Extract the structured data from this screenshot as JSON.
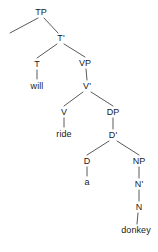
{
  "diagram": {
    "type": "syntax-tree",
    "sentence": "will ride a donkey",
    "background_color": "#ffffff",
    "line_color": "#5a5a5a",
    "text_color": "#1a1a1a",
    "width": 158,
    "height": 252,
    "nodes": [
      {
        "id": "TP",
        "label": "TP",
        "x": 41,
        "y": 12,
        "kind": "phrase"
      },
      {
        "id": "Tbar",
        "label": "T'",
        "x": 61,
        "y": 38,
        "kind": "bar"
      },
      {
        "id": "T",
        "label": "T",
        "x": 37,
        "y": 64,
        "kind": "head"
      },
      {
        "id": "will",
        "label": "will",
        "x": 37,
        "y": 86,
        "kind": "terminal"
      },
      {
        "id": "VP",
        "label": "VP",
        "x": 85,
        "y": 63,
        "kind": "phrase"
      },
      {
        "id": "Vbar",
        "label": "V'",
        "x": 87,
        "y": 86,
        "kind": "bar"
      },
      {
        "id": "V",
        "label": "V",
        "x": 64,
        "y": 112,
        "kind": "head"
      },
      {
        "id": "ride",
        "label": "ride",
        "x": 64,
        "y": 134,
        "kind": "terminal"
      },
      {
        "id": "DP",
        "label": "DP",
        "x": 113,
        "y": 112,
        "kind": "phrase"
      },
      {
        "id": "Dbar",
        "label": "D'",
        "x": 113,
        "y": 135,
        "kind": "bar"
      },
      {
        "id": "D",
        "label": "D",
        "x": 87,
        "y": 161,
        "kind": "head"
      },
      {
        "id": "a",
        "label": "a",
        "x": 87,
        "y": 182,
        "kind": "terminal"
      },
      {
        "id": "NP",
        "label": "NP",
        "x": 139,
        "y": 161,
        "kind": "phrase"
      },
      {
        "id": "Nbar",
        "label": "N'",
        "x": 139,
        "y": 184,
        "kind": "bar"
      },
      {
        "id": "N",
        "label": "N",
        "x": 139,
        "y": 207,
        "kind": "head"
      },
      {
        "id": "donkey",
        "label": "donkey",
        "x": 136,
        "y": 230,
        "kind": "terminal"
      }
    ],
    "edges": [
      {
        "from": "TP",
        "to": "specifier-empty",
        "x1": 38,
        "y1": 18,
        "x2": 10,
        "y2": 33
      },
      {
        "from": "TP",
        "to": "Tbar",
        "x1": 44,
        "y1": 18,
        "x2": 58,
        "y2": 33
      },
      {
        "from": "Tbar",
        "to": "T",
        "x1": 57,
        "y1": 44,
        "x2": 37,
        "y2": 58
      },
      {
        "from": "Tbar",
        "to": "VP",
        "x1": 64,
        "y1": 44,
        "x2": 85,
        "y2": 57
      },
      {
        "from": "T",
        "to": "will",
        "x1": 37,
        "y1": 70,
        "x2": 37,
        "y2": 79
      },
      {
        "from": "VP",
        "to": "Vbar",
        "x1": 86,
        "y1": 69,
        "x2": 87,
        "y2": 80
      },
      {
        "from": "Vbar",
        "to": "V",
        "x1": 83,
        "y1": 92,
        "x2": 64,
        "y2": 106
      },
      {
        "from": "Vbar",
        "to": "DP",
        "x1": 91,
        "y1": 92,
        "x2": 113,
        "y2": 106
      },
      {
        "from": "V",
        "to": "ride",
        "x1": 64,
        "y1": 118,
        "x2": 64,
        "y2": 127
      },
      {
        "from": "DP",
        "to": "Dbar",
        "x1": 113,
        "y1": 118,
        "x2": 113,
        "y2": 129
      },
      {
        "from": "Dbar",
        "to": "D",
        "x1": 109,
        "y1": 141,
        "x2": 87,
        "y2": 155
      },
      {
        "from": "Dbar",
        "to": "NP",
        "x1": 117,
        "y1": 141,
        "x2": 139,
        "y2": 155
      },
      {
        "from": "D",
        "to": "a",
        "x1": 87,
        "y1": 167,
        "x2": 87,
        "y2": 176
      },
      {
        "from": "NP",
        "to": "Nbar",
        "x1": 139,
        "y1": 167,
        "x2": 139,
        "y2": 178
      },
      {
        "from": "Nbar",
        "to": "N",
        "x1": 139,
        "y1": 190,
        "x2": 139,
        "y2": 201
      },
      {
        "from": "N",
        "to": "donkey",
        "x1": 138,
        "y1": 213,
        "x2": 137,
        "y2": 224
      }
    ]
  }
}
